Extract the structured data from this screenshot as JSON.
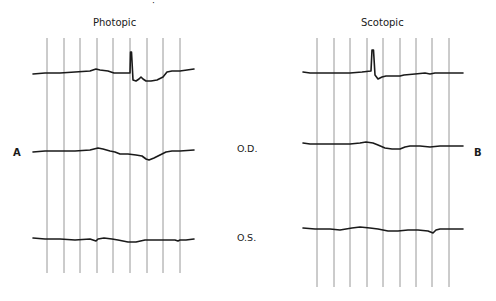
{
  "figure": {
    "panels": [
      {
        "id": "A",
        "title": "Photopic",
        "letter": "A",
        "gridlines_x": [
          47,
          64,
          80,
          97,
          113,
          130,
          147,
          163,
          180
        ],
        "grid_y": [
          38,
          273
        ],
        "traces": {
          "top": "M33,74 L45,73 L60,73 L75,72 L90,71 L96,69 L100,70 L108,71 L114,73 L122,73 L130,73 L130.5,52 L131.5,52 L133,80 L136,81 L139,79 L141,77 L143,79 L146,81 L151,81 L157,80 L163,77 L167,72 L172,71 L180,71 L194,69",
          "od": "M33,152 L45,151 L60,151 L75,151 L90,150 L98,148 L103,149 L110,151 L115,152 L120,154 L128,154 L136,155 L142,156 L146,159 L149,160 L154,158 L160,155 L166,152 L172,151 L180,151 L194,150",
          "os": "M33,238 L45,239 L60,239 L75,240 L90,239 L96,241 L98,239 L104,238 L112,239 L118,240 L128,242 L136,242 L145,240 L160,240 L175,240 L178,241 L180,240 L186,240 L194,239"
        }
      },
      {
        "id": "B",
        "title": "Scotopic",
        "letter": "B",
        "gridlines_x": [
          317,
          334,
          350,
          367,
          383,
          400,
          416,
          432,
          449
        ],
        "grid_y": [
          38,
          287
        ],
        "traces": {
          "top": "M303,72 L310,73 L320,73 L335,73 L350,73 L362,72 L371,71 L372,50 L373.5,50 L375,75 L378,79 L382,77 L386,76 L395,76 L400,76 L404,75 L415,74 L425,73 L430,74 L435,73 L450,73 L463,73",
          "od": "M303,143 L310,144 L320,144 L335,144 L350,144 L360,143 L366,142 L373,143 L378,145 L385,148 L392,149 L400,149 L405,147 L410,146 L420,146 L430,147 L440,146 L450,146 L463,146",
          "os": "M303,228 L315,229 L330,229 L340,230 L346,229 L352,228 L360,227 L370,228 L378,229 L388,231 L398,231 L408,230 L418,230 L428,231 L433,233 L436,230 L440,229 L450,229 L463,229"
        }
      }
    ],
    "row_labels": {
      "od": "O.D.",
      "os": "O.S."
    },
    "stray_mark": "·",
    "colors": {
      "trace": "#1a1a1a",
      "grid": "#8c8c8c",
      "background": "#ffffff"
    }
  }
}
